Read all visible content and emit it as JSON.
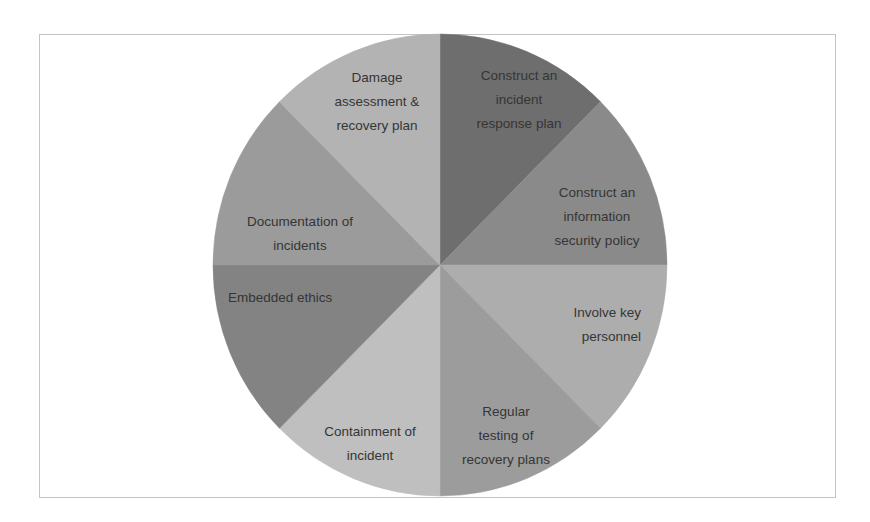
{
  "chart_data": {
    "type": "pie",
    "title": "",
    "start_angle_deg": 0,
    "direction": "clockwise",
    "center": [
      440,
      265
    ],
    "radius_x": 227,
    "radius_y": 231,
    "legend": "none (labels inside slices)",
    "slices": [
      {
        "label": "Construct an incident response plan",
        "lines": [
          "Construct an",
          "incident",
          "response plan"
        ],
        "value": 12.5,
        "color": "#6e6e6e",
        "label_pos": [
          519,
          80
        ],
        "anchor": "middle"
      },
      {
        "label": "Construct an information security policy",
        "lines": [
          "Construct an",
          "information",
          "security policy"
        ],
        "value": 12.5,
        "color": "#8a8a8a",
        "label_pos": [
          597,
          197
        ],
        "anchor": "middle"
      },
      {
        "label": "Involve key personnel",
        "lines": [
          "Involve key",
          "personnel"
        ],
        "value": 12.5,
        "color": "#adadad",
        "label_pos": [
          641,
          317
        ],
        "anchor": "end"
      },
      {
        "label": "Regular testing of recovery plans",
        "lines": [
          "Regular",
          "testing of",
          "recovery plans"
        ],
        "value": 12.5,
        "color": "#9c9c9c",
        "label_pos": [
          506,
          416
        ],
        "anchor": "middle"
      },
      {
        "label": "Containment of incident",
        "lines": [
          "Containment of",
          "incident"
        ],
        "value": 12.5,
        "color": "#bfbfbf",
        "label_pos": [
          370,
          436
        ],
        "anchor": "middle"
      },
      {
        "label": "Embedded ethics",
        "lines": [
          "Embedded ethics"
        ],
        "value": 12.5,
        "color": "#838383",
        "label_pos": [
          228,
          302
        ],
        "anchor": "start"
      },
      {
        "label": "Documentation of incidents",
        "lines": [
          "Documentation of",
          "incidents"
        ],
        "value": 12.5,
        "color": "#9b9b9b",
        "label_pos": [
          300,
          226
        ],
        "anchor": "middle"
      },
      {
        "label": "Damage assessment & recovery plan",
        "lines": [
          "Damage",
          "assessment &",
          "recovery plan"
        ],
        "value": 12.5,
        "color": "#b3b3b3",
        "label_pos": [
          377,
          82
        ],
        "anchor": "middle"
      }
    ]
  },
  "frame": {
    "border_color": "#c4c4c4"
  }
}
